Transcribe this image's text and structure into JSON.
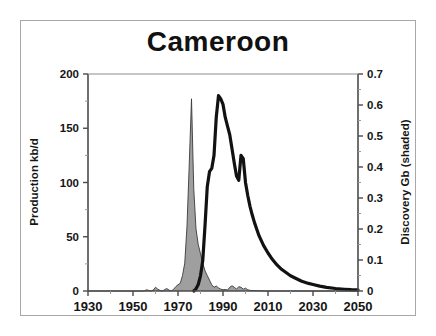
{
  "figure": {
    "title": "Cameroon",
    "frame_color": "#a8a8a8",
    "background": "#ffffff"
  },
  "chart_data": {
    "type": "area",
    "title": "Cameroon",
    "xlabel": "",
    "ylabel": "Production kb/d",
    "y2label": "Discovery Gb (shaded)",
    "xlim": [
      1930,
      2050
    ],
    "ylim": [
      0,
      200
    ],
    "y2lim": [
      0,
      0.7
    ],
    "grid": false,
    "legend": "none",
    "x_ticks": [
      1930,
      1950,
      1970,
      1990,
      2010,
      2030,
      2050
    ],
    "x_tick_labels": [
      "1930",
      "1950",
      "1970",
      "1990",
      "2010",
      "2030",
      "2050"
    ],
    "x_minor_step": 10,
    "y_ticks": [
      0,
      50,
      100,
      150,
      200
    ],
    "y_tick_labels": [
      "0",
      "50",
      "100",
      "150",
      "200"
    ],
    "y_minor_step": 25,
    "y2_ticks": [
      0,
      0.1,
      0.2,
      0.3,
      0.4,
      0.5,
      0.6,
      0.7
    ],
    "y2_tick_labels": [
      "0",
      "0.1",
      "0.2",
      "0.3",
      "0.4",
      "0.5",
      "0.6",
      "0.7"
    ],
    "y2_minor_step": 0.05,
    "series": [
      {
        "name": "Discovery Gb (shaded)",
        "type": "area",
        "axis": "right",
        "fill_color": "#9a9a9a",
        "line_color": "#3a3a3a",
        "x": [
          1930,
          1955,
          1956,
          1957,
          1958,
          1959,
          1960,
          1961,
          1962,
          1963,
          1964,
          1965,
          1966,
          1967,
          1968,
          1969,
          1970,
          1971,
          1972,
          1973,
          1974,
          1975,
          1976,
          1977,
          1978,
          1979,
          1980,
          1981,
          1982,
          1983,
          1984,
          1985,
          1986,
          1987,
          1988,
          1989,
          1990,
          1991,
          1992,
          1993,
          1994,
          1995,
          1996,
          1997,
          1998,
          1999,
          2000,
          2001,
          2002,
          2005,
          2010,
          2050
        ],
        "values": [
          0,
          0,
          0.004,
          0.002,
          0,
          0.003,
          0.012,
          0.006,
          0.002,
          0,
          0.004,
          0.008,
          0.003,
          0,
          0.005,
          0.014,
          0.02,
          0.025,
          0.05,
          0.09,
          0.21,
          0.41,
          0.62,
          0.33,
          0.2,
          0.15,
          0.12,
          0.09,
          0.065,
          0.05,
          0.035,
          0.02,
          0.012,
          0.016,
          0.01,
          0.006,
          0.004,
          0.005,
          0.003,
          0.012,
          0.017,
          0.012,
          0.006,
          0.014,
          0.012,
          0.006,
          0.009,
          0.004,
          0.002,
          0.001,
          0,
          0
        ]
      },
      {
        "name": "Production kb/d",
        "type": "line",
        "axis": "left",
        "line_color": "#121212",
        "line_width": 3.2,
        "x": [
          1977,
          1978,
          1979,
          1980,
          1981,
          1982,
          1983,
          1984,
          1985,
          1986,
          1987,
          1988,
          1989,
          1990,
          1991,
          1992,
          1993,
          1994,
          1995,
          1996,
          1997,
          1998,
          1999,
          2000,
          2001,
          2002,
          2003,
          2004,
          2005,
          2006,
          2008,
          2010,
          2012,
          2014,
          2016,
          2018,
          2020,
          2022,
          2025,
          2028,
          2030,
          2033,
          2036,
          2040,
          2044,
          2047,
          2050
        ],
        "values": [
          0,
          2,
          6,
          14,
          28,
          60,
          96,
          110,
          113,
          125,
          160,
          180,
          177,
          172,
          160,
          152,
          144,
          131,
          118,
          106,
          102,
          125,
          122,
          100,
          88,
          78,
          70,
          63,
          57,
          51,
          42,
          35,
          29,
          24,
          20,
          17,
          14,
          12,
          9,
          7,
          6,
          4.5,
          3.4,
          2.3,
          1.6,
          1.2,
          1
        ]
      }
    ]
  },
  "axes": {
    "left": {
      "title": "Production kb/d",
      "tick_labels": [
        "200",
        "150",
        "100",
        "50",
        "0"
      ]
    },
    "right": {
      "title": "Discovery Gb (shaded)",
      "tick_labels": [
        "0.7",
        "0.6",
        "0.5",
        "0.4",
        "0.3",
        "0.2",
        "0.1",
        "0"
      ]
    },
    "bottom": {
      "tick_labels": [
        "1930",
        "1950",
        "1970",
        "1990",
        "2010",
        "2030",
        "2050"
      ]
    }
  }
}
